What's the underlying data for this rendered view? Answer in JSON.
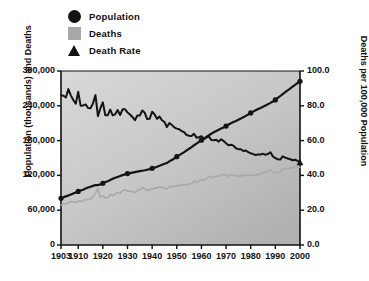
{
  "legend": {
    "position": "top-left",
    "items": [
      {
        "label": "Population",
        "marker": "circle-icon",
        "color": "#141414"
      },
      {
        "label": "Deaths",
        "marker": "square-icon",
        "color": "#a8a8a8"
      },
      {
        "label": "Death Rate",
        "marker": "triangle-icon",
        "color": "#141414"
      }
    ]
  },
  "chart_data": {
    "type": "line",
    "title": "",
    "xlabel": "",
    "ylabel": "Population (thousands) and Deaths",
    "y2label": "Deaths per 100,000 Population",
    "xlim": [
      1903,
      2000
    ],
    "ylim": [
      0,
      300000
    ],
    "y2lim": [
      0.0,
      100.0
    ],
    "grid": false,
    "xticks": [
      "1903",
      "1910",
      "1920",
      "1930",
      "1940",
      "1950",
      "1960",
      "1970",
      "1980",
      "1990",
      "2000"
    ],
    "xtick_values": [
      1903,
      1910,
      1920,
      1930,
      1940,
      1950,
      1960,
      1970,
      1980,
      1990,
      2000
    ],
    "yticks": [
      "0",
      "60,000",
      "120,000",
      "180,000",
      "240,000",
      "300,000"
    ],
    "ytick_values": [
      0,
      60000,
      120000,
      180000,
      240000,
      300000
    ],
    "y2ticks": [
      "0.0",
      "20.0",
      "40.0",
      "60.0",
      "80.0",
      "100.0"
    ],
    "y2tick_values": [
      0,
      20,
      40,
      60,
      80,
      100
    ],
    "series": [
      {
        "name": "Population",
        "axis": "left",
        "color": "#141414",
        "marker": "circle",
        "marker_years": [
          1903,
          1910,
          1920,
          1930,
          1940,
          1950,
          1960,
          1970,
          1980,
          1990,
          2000
        ],
        "x": [
          1903,
          1904,
          1905,
          1906,
          1907,
          1908,
          1909,
          1910,
          1911,
          1912,
          1913,
          1914,
          1915,
          1916,
          1917,
          1918,
          1919,
          1920,
          1921,
          1922,
          1923,
          1924,
          1925,
          1926,
          1927,
          1928,
          1929,
          1930,
          1931,
          1932,
          1933,
          1934,
          1935,
          1936,
          1937,
          1938,
          1939,
          1940,
          1941,
          1942,
          1943,
          1944,
          1945,
          1946,
          1947,
          1948,
          1949,
          1950,
          1951,
          1952,
          1953,
          1954,
          1955,
          1956,
          1957,
          1958,
          1959,
          1960,
          1961,
          1962,
          1963,
          1964,
          1965,
          1966,
          1967,
          1968,
          1969,
          1970,
          1971,
          1972,
          1973,
          1974,
          1975,
          1976,
          1977,
          1978,
          1979,
          1980,
          1981,
          1982,
          1983,
          1984,
          1985,
          1986,
          1987,
          1988,
          1989,
          1990,
          1991,
          1992,
          1993,
          1994,
          1995,
          1996,
          1997,
          1998,
          1999,
          2000
        ],
        "values": [
          80632,
          82165,
          83820,
          85437,
          87000,
          88709,
          90492,
          92407,
          93863,
          95335,
          97225,
          99111,
          100546,
          101961,
          103268,
          103208,
          104514,
          106461,
          108538,
          110049,
          111947,
          114109,
          115829,
          117397,
          119035,
          120509,
          121767,
          123077,
          124040,
          124840,
          125579,
          126374,
          127250,
          128053,
          128825,
          129825,
          130880,
          132122,
          133402,
          134860,
          136739,
          138397,
          139928,
          141389,
          144126,
          146631,
          149188,
          152271,
          154878,
          157553,
          160184,
          163026,
          165931,
          168903,
          171984,
          174882,
          177830,
          180671,
          183691,
          186538,
          189242,
          191889,
          194303,
          196560,
          198712,
          200706,
          202677,
          205052,
          207661,
          209896,
          211909,
          213854,
          215973,
          218035,
          220239,
          222585,
          225055,
          227726,
          229966,
          232188,
          234307,
          236348,
          238466,
          240651,
          242804,
          245021,
          247342,
          250132,
          253493,
          256894,
          260255,
          263436,
          266557,
          269667,
          272912,
          276115,
          279295,
          282339
        ]
      },
      {
        "name": "Deaths",
        "axis": "left",
        "color": "#a8a8a8",
        "marker": "none",
        "x": [
          1903,
          1904,
          1905,
          1906,
          1907,
          1908,
          1909,
          1910,
          1911,
          1912,
          1913,
          1914,
          1915,
          1916,
          1917,
          1918,
          1919,
          1920,
          1921,
          1922,
          1923,
          1924,
          1925,
          1926,
          1927,
          1928,
          1929,
          1930,
          1931,
          1932,
          1933,
          1934,
          1935,
          1936,
          1937,
          1938,
          1939,
          1940,
          1941,
          1942,
          1943,
          1944,
          1945,
          1946,
          1947,
          1948,
          1949,
          1950,
          1951,
          1952,
          1953,
          1954,
          1955,
          1956,
          1957,
          1958,
          1959,
          1960,
          1961,
          1962,
          1963,
          1964,
          1965,
          1966,
          1967,
          1968,
          1969,
          1970,
          1971,
          1972,
          1973,
          1974,
          1975,
          1976,
          1977,
          1978,
          1979,
          1980,
          1981,
          1982,
          1983,
          1984,
          1985,
          1986,
          1987,
          1988,
          1989,
          1990,
          1991,
          1992,
          1993,
          1994,
          1995,
          1996,
          1997,
          1998,
          1999,
          2000
        ],
        "values": [
          69000,
          70500,
          71000,
          73000,
          75000,
          74000,
          73500,
          76000,
          75000,
          76500,
          78500,
          78000,
          79000,
          83000,
          89000,
          97000,
          82000,
          85000,
          81000,
          82000,
          87000,
          85000,
          87000,
          91000,
          89000,
          94000,
          95000,
          93000,
          93000,
          92000,
          90000,
          94000,
          95000,
          99000,
          97000,
          94000,
          95000,
          97000,
          98000,
          98000,
          101000,
          99000,
          99000,
          96000,
          101000,
          101000,
          101000,
          102000,
          103000,
          103000,
          104000,
          103000,
          105000,
          106000,
          110000,
          108000,
          110000,
          113000,
          112000,
          115000,
          118000,
          116000,
          117000,
          119000,
          118000,
          122000,
          121000,
          120000,
          119000,
          121000,
          121000,
          119000,
          119000,
          120000,
          119000,
          121000,
          120000,
          120000,
          120000,
          120000,
          122000,
          123000,
          125000,
          125000,
          127000,
          129000,
          126000,
          125000,
          125000,
          126000,
          131000,
          132000,
          132000,
          133000,
          133000,
          135000,
          135000,
          134000
        ]
      },
      {
        "name": "Death Rate",
        "axis": "right",
        "color": "#141414",
        "marker": "triangle",
        "marker_years": [
          2000
        ],
        "x": [
          1903,
          1904,
          1905,
          1906,
          1907,
          1908,
          1909,
          1910,
          1911,
          1912,
          1913,
          1914,
          1915,
          1916,
          1917,
          1918,
          1919,
          1920,
          1921,
          1922,
          1923,
          1924,
          1925,
          1926,
          1927,
          1928,
          1929,
          1930,
          1931,
          1932,
          1933,
          1934,
          1935,
          1936,
          1937,
          1938,
          1939,
          1940,
          1941,
          1942,
          1943,
          1944,
          1945,
          1946,
          1947,
          1948,
          1949,
          1950,
          1951,
          1952,
          1953,
          1954,
          1955,
          1956,
          1957,
          1958,
          1959,
          1960,
          1961,
          1962,
          1963,
          1964,
          1965,
          1966,
          1967,
          1968,
          1969,
          1970,
          1971,
          1972,
          1973,
          1974,
          1975,
          1976,
          1977,
          1978,
          1979,
          1980,
          1981,
          1982,
          1983,
          1984,
          1985,
          1986,
          1987,
          1988,
          1989,
          1990,
          1991,
          1992,
          1993,
          1994,
          1995,
          1996,
          1997,
          1998,
          1999,
          2000
        ],
        "values": [
          86.1,
          85.8,
          84.8,
          89.6,
          86.0,
          83.3,
          81.2,
          88.0,
          80.0,
          80.2,
          80.8,
          78.7,
          78.6,
          81.4,
          86.2,
          74.0,
          78.6,
          82.0,
          74.5,
          74.6,
          77.8,
          74.5,
          75.1,
          77.6,
          74.7,
          78.0,
          78.0,
          76.2,
          75.0,
          73.6,
          71.7,
          74.4,
          74.4,
          77.3,
          76.0,
          72.4,
          72.6,
          76.6,
          75.0,
          72.5,
          73.8,
          71.7,
          70.7,
          67.8,
          70.1,
          68.9,
          67.6,
          66.9,
          66.5,
          65.4,
          64.8,
          63.2,
          62.8,
          62.6,
          63.9,
          61.7,
          61.9,
          62.5,
          60.9,
          61.7,
          62.3,
          60.4,
          60.2,
          60.5,
          59.4,
          60.8,
          59.8,
          58.5,
          57.3,
          57.6,
          57.1,
          55.6,
          55.1,
          55.0,
          54.0,
          54.3,
          53.4,
          52.7,
          52.2,
          51.7,
          52.0,
          52.0,
          52.4,
          51.9,
          52.3,
          53.3,
          50.9,
          49.9,
          49.3,
          49.1,
          51.0,
          50.2,
          49.7,
          49.3,
          48.7,
          49.0,
          48.3,
          47.5
        ]
      }
    ]
  }
}
